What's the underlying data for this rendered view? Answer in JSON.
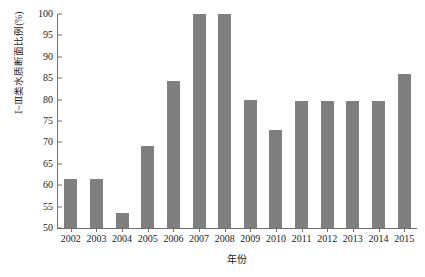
{
  "chart_data": {
    "type": "bar",
    "title": "",
    "subtitle": "",
    "xlabel": "年份",
    "ylabel": "Ⅰ~Ⅲ类水质断面比例(%)",
    "categories": [
      "2002",
      "2003",
      "2004",
      "2005",
      "2006",
      "2007",
      "2008",
      "2009",
      "2010",
      "2011",
      "2012",
      "2013",
      "2014",
      "2015"
    ],
    "values": [
      61.4,
      61.4,
      53.6,
      69.2,
      84.3,
      100,
      100,
      79.8,
      73.0,
      79.7,
      79.7,
      79.7,
      79.6,
      86.1
    ],
    "series": [
      {
        "name": "Ⅰ~Ⅲ类水质断面比例",
        "values": [
          61.4,
          61.4,
          53.6,
          69.2,
          84.3,
          100,
          100,
          79.8,
          73.0,
          79.7,
          79.7,
          79.7,
          79.6,
          86.1
        ]
      }
    ],
    "ylim": [
      50,
      100
    ],
    "yticks": [
      50,
      55,
      60,
      65,
      70,
      75,
      80,
      85,
      90,
      95,
      100
    ],
    "ytick_labels": [
      "50",
      "55",
      "60",
      "65",
      "70",
      "75",
      "80",
      "85",
      "90",
      "95",
      "100"
    ],
    "grid": false,
    "legend": false,
    "legend_position": "none",
    "bar_color": "#7f7f7f",
    "axis_color": "#6e6e6e",
    "text_color": "#1a1a1a",
    "background": "#ffffff"
  }
}
